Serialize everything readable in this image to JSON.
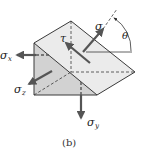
{
  "figure": {
    "caption": "(b)",
    "labels": {
      "sigma": "σ",
      "tau": "τ",
      "theta": "θ",
      "sigma_x_main": "σ",
      "sigma_x_sub": "x",
      "sigma_y_main": "σ",
      "sigma_y_sub": "y",
      "sigma_z_main": "σ",
      "sigma_z_sub": "z"
    },
    "colors": {
      "front_face": "#d2d2d2",
      "inclined_face": "#ebebeb",
      "bottom_face": "#e4e4e4",
      "edge": "#3a3a3a",
      "arrow": "#555555",
      "background": "#ffffff"
    }
  }
}
